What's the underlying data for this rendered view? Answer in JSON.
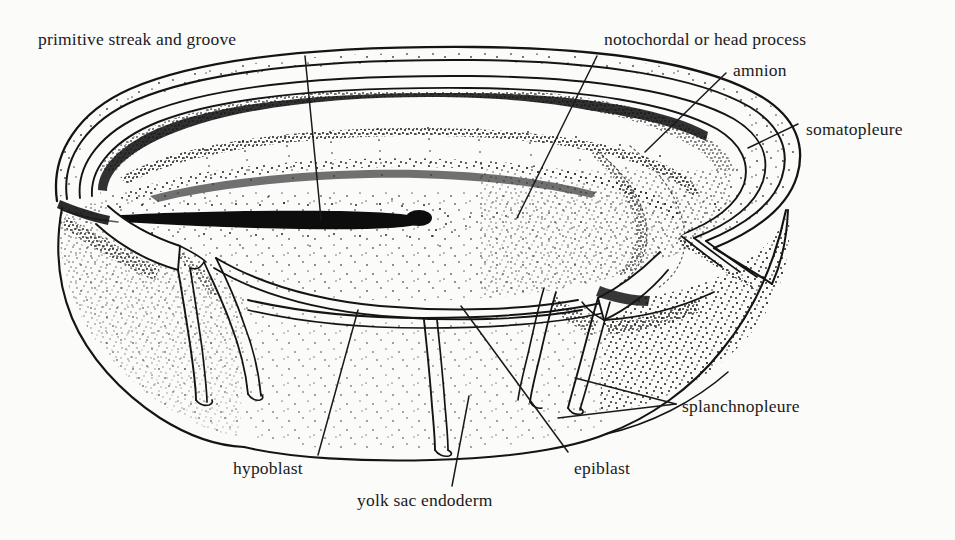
{
  "figure": {
    "kind": "anatomical-line-drawing",
    "style": "black ink stipple drawing on off-white background",
    "background_color": "#fbfbfa",
    "ink_color": "#111111"
  },
  "labels": [
    {
      "id": "primitive-streak",
      "text": "primitive streak and groove",
      "x": 38,
      "y": 29,
      "leader": {
        "from": [
          305,
          56
        ],
        "to": [
          321,
          219
        ]
      }
    },
    {
      "id": "notochordal-process",
      "text": "notochordal or head process",
      "x": 604,
      "y": 29,
      "leader": {
        "from": [
          597,
          56
        ],
        "to": [
          517,
          218
        ]
      }
    },
    {
      "id": "amnion",
      "text": "amnion",
      "x": 733,
      "y": 60,
      "leader": {
        "from": [
          726,
          73
        ],
        "to": [
          645,
          152
        ]
      }
    },
    {
      "id": "somatopleure",
      "text": "somatopleure",
      "x": 806,
      "y": 119,
      "leader": {
        "from": [
          798,
          124
        ],
        "to": [
          748,
          148
        ]
      }
    },
    {
      "id": "splanchnopleure",
      "text": "splanchnopleure",
      "x": 682,
      "y": 396,
      "leader_a": {
        "from": [
          676,
          404
        ],
        "to": [
          575,
          378
        ]
      },
      "leader_b": {
        "from": [
          676,
          404
        ],
        "to": [
          558,
          418
        ]
      }
    },
    {
      "id": "hypoblast",
      "text": "hypoblast",
      "x": 233,
      "y": 458,
      "leader": {
        "from": [
          318,
          455
        ],
        "to": [
          358,
          310
        ]
      }
    },
    {
      "id": "epiblast",
      "text": "epiblast",
      "x": 574,
      "y": 458,
      "leader": {
        "from": [
          568,
          452
        ],
        "to": [
          461,
          306
        ]
      }
    },
    {
      "id": "yolk-sac-endoderm",
      "text": "yolk sac endoderm",
      "x": 357,
      "y": 490,
      "leader": {
        "from": [
          452,
          486
        ],
        "to": [
          469,
          396
        ]
      }
    }
  ]
}
